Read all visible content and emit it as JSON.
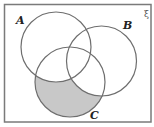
{
  "diagram": {
    "type": "venn",
    "universal_symbol": "ξ",
    "sets": [
      {
        "label": "A",
        "cx": 56,
        "cy": 47,
        "r": 35
      },
      {
        "label": "B",
        "cx": 101.5,
        "cy": 61,
        "r": 35
      },
      {
        "label": "C",
        "cx": 70,
        "cy": 82,
        "r": 35
      }
    ],
    "shaded_region": "C only (C ∩ A' ∩ B')",
    "colors": {
      "frame": "#7a7a7a",
      "circle_stroke": "#6e6e6e",
      "shade": "#c8c8c8",
      "background": "#ffffff"
    }
  }
}
